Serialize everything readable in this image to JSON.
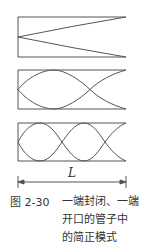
{
  "figure": {
    "number": "图 2-30",
    "caption_lines": [
      "一端封闭、一端",
      "开口的管子中",
      "的简正模式"
    ],
    "dimension_label": "L",
    "line_color": "#555555"
  },
  "panels": [
    {
      "name": "mode-1",
      "description": "quarter-wavelength mode"
    },
    {
      "name": "mode-2",
      "description": "three-quarter-wavelength mode"
    },
    {
      "name": "mode-3",
      "description": "five-quarter-wavelength mode"
    }
  ]
}
